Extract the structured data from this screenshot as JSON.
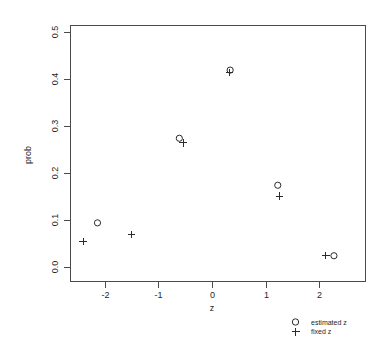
{
  "chart_data": {
    "type": "scatter",
    "title": "",
    "xlabel": "z",
    "ylabel": "prob",
    "xlim": [
      -2.65,
      2.6
    ],
    "ylim": [
      -0.015,
      0.52
    ],
    "grid": false,
    "legend_position": "bottom-right-outside",
    "xticks": [
      "-2",
      "-1",
      "0",
      "1",
      "2"
    ],
    "xtick_values": [
      -2,
      -1,
      0,
      1,
      2
    ],
    "yticks": [
      "0.0",
      "0.1",
      "0.2",
      "0.3",
      "0.4",
      "0.5"
    ],
    "ytick_values": [
      0.0,
      0.1,
      0.2,
      0.3,
      0.4,
      0.5
    ],
    "series": [
      {
        "name": "estimated z",
        "marker": "circle",
        "x": [
          -2.15,
          -0.62,
          0.33,
          1.22,
          2.27
        ],
        "y": [
          0.095,
          0.275,
          0.42,
          0.175,
          0.025
        ]
      },
      {
        "name": "fixed z",
        "marker": "plus",
        "x": [
          -2.42,
          -1.52,
          -0.55,
          0.32,
          1.25,
          2.12
        ],
        "y": [
          0.055,
          0.07,
          0.265,
          0.415,
          0.152,
          0.025
        ]
      }
    ]
  },
  "legend": {
    "entries": [
      {
        "label": "estimated z",
        "marker": "circle"
      },
      {
        "label": "fixed z",
        "marker": "plus"
      }
    ]
  },
  "axes": {
    "x_title": "z",
    "y_title": "prob"
  }
}
